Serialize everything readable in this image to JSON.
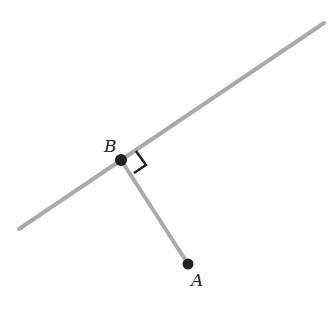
{
  "diagram": {
    "line": {
      "x1": 19,
      "y1": 229,
      "x2": 324,
      "y2": 23,
      "color": "#aaaaaa"
    },
    "segment": {
      "from": "B",
      "to": "A",
      "color": "#aaaaaa"
    },
    "points": [
      {
        "id": "B",
        "label": "B",
        "x": 121,
        "y": 160,
        "label_x": 104,
        "label_y": 152
      },
      {
        "id": "A",
        "label": "A",
        "x": 188,
        "y": 264,
        "label_x": 191,
        "label_y": 286
      }
    ],
    "right_angle_marker": {
      "at": "B",
      "color": "#222222"
    },
    "point_color": "#222222"
  }
}
